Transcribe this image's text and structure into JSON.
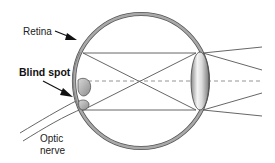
{
  "diagram": {
    "labels": {
      "retina": "Retina",
      "blind_spot": "Blind spot",
      "optic_line1": "Optic",
      "optic_line2": "nerve"
    },
    "colors": {
      "eyeball_outline": "#8f8f8f",
      "eyeball_edge": "#555555",
      "rays": "#555555",
      "axis_dash": "#888888",
      "lens_light": "#f4f4f4",
      "lens_dark": "#8a8a8a",
      "text": "#222222"
    },
    "geometry": {
      "eye_center": [
        141,
        81
      ],
      "eye_radius": 67,
      "lens_center": [
        200,
        81
      ],
      "lens_half_width": 9,
      "lens_half_height": 29,
      "ray_top_y": 53,
      "ray_bottom_y": 110,
      "ray_exit_x": 262,
      "ray_exit_ys": [
        47,
        70,
        93,
        116
      ]
    }
  }
}
